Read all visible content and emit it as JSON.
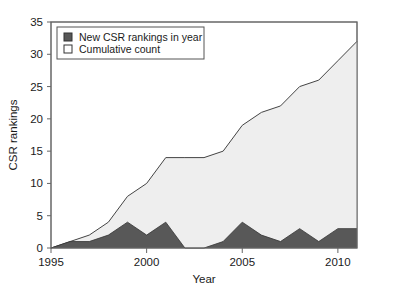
{
  "chart_data": {
    "type": "area",
    "title": "",
    "subtitle": "",
    "xlabel": "Year",
    "ylabel": "CSR rankings",
    "x": [
      1995,
      1996,
      1997,
      1998,
      1999,
      2000,
      2001,
      2002,
      2003,
      2004,
      2005,
      2006,
      2007,
      2008,
      2009,
      2010,
      2011
    ],
    "xlim": [
      1995,
      2011
    ],
    "ylim": [
      0,
      35
    ],
    "xticks": [
      1995,
      2000,
      2005,
      2010
    ],
    "xtick_labels": [
      "1995",
      "2000",
      "2005",
      "2010"
    ],
    "yticks": [
      0,
      5,
      10,
      15,
      20,
      25,
      30,
      35
    ],
    "ytick_labels": [
      "0",
      "5",
      "10",
      "15",
      "20",
      "25",
      "30",
      "35"
    ],
    "grid": false,
    "legend_position": "top-left",
    "series": [
      {
        "name": "New CSR rankings in year",
        "key": "new_rankings",
        "fill": "#585858",
        "edge": "#333333",
        "values": [
          0,
          1,
          1,
          2,
          4,
          2,
          4,
          0,
          0,
          1,
          4,
          2,
          1,
          3,
          1,
          3,
          3
        ]
      },
      {
        "name": "Cumulative count",
        "key": "cumulative",
        "fill": "#eeeeee",
        "edge": "#444444",
        "values": [
          0,
          1,
          2,
          4,
          8,
          10,
          14,
          14,
          14,
          15,
          19,
          21,
          22,
          25,
          26,
          29,
          32
        ]
      }
    ]
  },
  "legend": {
    "items": [
      {
        "label": "New CSR rankings in year",
        "swatch": "filled-dark-square-icon"
      },
      {
        "label": "Cumulative count",
        "swatch": "open-light-square-icon"
      }
    ]
  },
  "axes": {
    "x_title": "Year",
    "y_title": "CSR rankings"
  },
  "colors": {
    "new_rankings_fill": "#585858",
    "cumulative_fill": "#eeeeee",
    "line": "#444444",
    "frame": "#666666",
    "text": "#1a1a1a",
    "background": "#ffffff"
  }
}
